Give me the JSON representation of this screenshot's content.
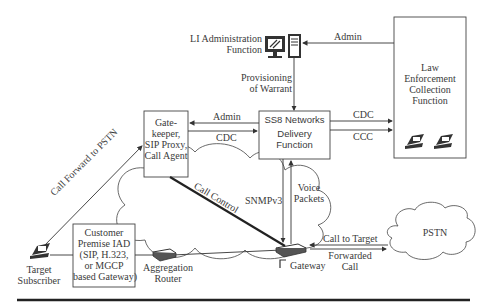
{
  "nodes": {
    "li_admin": {
      "label_line1": "LI Administration",
      "label_line2": "Function"
    },
    "lea": {
      "line1": "Law",
      "line2": "Enforcement",
      "line3": "Collection",
      "line4": "Function"
    },
    "delivery": {
      "line1": "SS8 Networks",
      "line2": "Delivery",
      "line3": "Function"
    },
    "gatekeeper": {
      "line1": "Gate-",
      "line2": "keeper,",
      "line3": "SIP Proxy,",
      "line4": "Call Agent"
    },
    "iad": {
      "line1": "Customer",
      "line2": "Premise IAD",
      "line3": "(SIP, H.323,",
      "line4": "or MGCP",
      "line5": "based Gateway)"
    },
    "target": {
      "line1": "Target",
      "line2": "Subscriber"
    },
    "router": {
      "line1": "Aggregation",
      "line2": "Router"
    },
    "gateway": {
      "label": "Gateway"
    },
    "pstn": {
      "label": "PSTN"
    }
  },
  "edges": {
    "admin_top": "Admin",
    "provisioning_line1": "Provisioning",
    "provisioning_line2": "of Warrant",
    "admin_mid": "Admin",
    "cdc_mid": "CDC",
    "cdc_right": "CDC",
    "ccc_right": "CCC",
    "call_forward": "Call Forward to PSTN",
    "call_control": "Call Control",
    "snmp": "SNMPv3",
    "voice_line1": "Voice",
    "voice_line2": "Packets",
    "call_to_target": "Call to Target",
    "forwarded_line1": "Forwarded",
    "forwarded_line2": "Call"
  },
  "icons": [
    "monitor-icon",
    "server-tower-icon",
    "desk-phone-icon",
    "router-icon",
    "gateway-icon",
    "cloud-icon"
  ]
}
